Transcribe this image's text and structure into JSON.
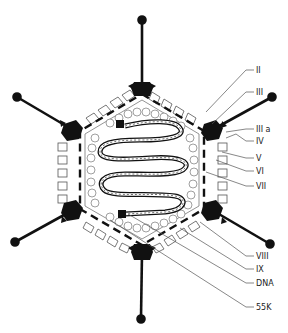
{
  "diagram": {
    "colors": {
      "ink": "#111111",
      "line": "#333333",
      "background": "#ffffff"
    },
    "labels": [
      {
        "text": "II",
        "y": 70
      },
      {
        "text": "III",
        "y": 92
      },
      {
        "text": "III a",
        "y": 129
      },
      {
        "text": "IV",
        "y": 141
      },
      {
        "text": "V",
        "y": 158
      },
      {
        "text": "VI",
        "y": 171
      },
      {
        "text": "VII",
        "y": 186
      },
      {
        "text": "VIII",
        "y": 256
      },
      {
        "text": "IX",
        "y": 269
      },
      {
        "text": "DNA",
        "y": 283
      },
      {
        "text": "55K",
        "y": 307
      }
    ]
  }
}
